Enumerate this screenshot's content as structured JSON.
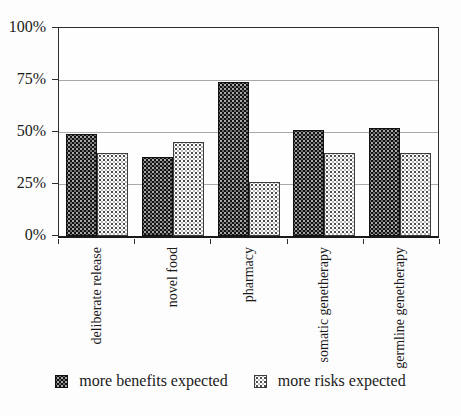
{
  "chart_data": {
    "type": "bar",
    "title": "",
    "xlabel": "",
    "ylabel": "",
    "categories": [
      "deliberate release",
      "novel food",
      "pharmacy",
      "somatic genetherapy",
      "germline genetherapy"
    ],
    "series": [
      {
        "name": "more benefits expected",
        "values": [
          49,
          38,
          74,
          51,
          52
        ]
      },
      {
        "name": "more risks expected",
        "values": [
          40,
          45,
          26,
          40,
          40
        ]
      }
    ],
    "ylim": [
      0,
      100
    ],
    "yticks": [
      {
        "label": "0%",
        "value": 0
      },
      {
        "label": "25%",
        "value": 25
      },
      {
        "label": "50%",
        "value": 50
      },
      {
        "label": "75%",
        "value": 75
      },
      {
        "label": "100%",
        "value": 100
      }
    ],
    "grid": true,
    "legend_position": "bottom"
  },
  "colors": {
    "benefits_fill": "#121212",
    "risks_fill": "#fefefe",
    "gridline": "#a9a9a9",
    "frame": "#2e2e2e",
    "text": "#1a1a1a"
  }
}
